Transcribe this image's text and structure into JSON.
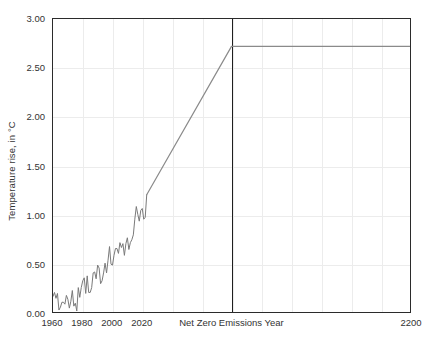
{
  "chart_data": {
    "type": "line",
    "title": "",
    "xlabel": "",
    "ylabel": "Temperature rise, in °C",
    "xlim": [
      1960,
      2200
    ],
    "ylim": [
      0.0,
      3.0
    ],
    "grid": true,
    "legend": null,
    "y_ticks": [
      "0.00",
      "0.50",
      "1.00",
      "1.50",
      "2.00",
      "2.50",
      "3.00"
    ],
    "y_tick_values": [
      0.0,
      0.5,
      1.0,
      1.5,
      2.0,
      2.5,
      3.0
    ],
    "x_ticks": [
      "1960",
      "1980",
      "2000",
      "2020",
      "Net Zero Emissions Year",
      "2200"
    ],
    "x_tick_values": [
      1960,
      1980,
      2000,
      2020,
      2080,
      2200
    ],
    "annotations": [
      {
        "name": "net-zero-emissions-year",
        "label": "Net Zero Emissions Year",
        "x": 2080,
        "type": "vertical-line"
      }
    ],
    "series": [
      {
        "name": "observed-temperature-rise",
        "style": "jagged-annual",
        "color": "#7a7a7a",
        "x": [
          1960,
          1961,
          1962,
          1963,
          1964,
          1965,
          1966,
          1967,
          1968,
          1969,
          1970,
          1971,
          1972,
          1973,
          1974,
          1975,
          1976,
          1977,
          1978,
          1979,
          1980,
          1981,
          1982,
          1983,
          1984,
          1985,
          1986,
          1987,
          1988,
          1989,
          1990,
          1991,
          1992,
          1993,
          1994,
          1995,
          1996,
          1997,
          1998,
          1999,
          2000,
          2001,
          2002,
          2003,
          2004,
          2005,
          2006,
          2007,
          2008,
          2009,
          2010,
          2011,
          2012,
          2013,
          2014,
          2015,
          2016,
          2017,
          2018,
          2019,
          2020,
          2021,
          2022,
          2023
        ],
        "values": [
          0.16,
          0.2,
          0.14,
          0.19,
          0.02,
          0.05,
          0.1,
          0.1,
          0.08,
          0.17,
          0.13,
          0.04,
          0.11,
          0.22,
          0.06,
          0.09,
          0.01,
          0.25,
          0.15,
          0.25,
          0.32,
          0.35,
          0.19,
          0.37,
          0.2,
          0.2,
          0.25,
          0.4,
          0.41,
          0.34,
          0.48,
          0.45,
          0.29,
          0.32,
          0.4,
          0.5,
          0.4,
          0.53,
          0.67,
          0.49,
          0.48,
          0.58,
          0.65,
          0.65,
          0.6,
          0.71,
          0.66,
          0.7,
          0.58,
          0.7,
          0.76,
          0.64,
          0.71,
          0.74,
          0.79,
          0.95,
          1.08,
          1.0,
          0.93,
          1.04,
          1.06,
          0.95,
          0.97,
          1.2
        ]
      },
      {
        "name": "projected-temperature-rise",
        "style": "smooth-linear",
        "color": "#8a8a8a",
        "x": [
          2023,
          2080,
          2200
        ],
        "values": [
          1.2,
          2.72,
          2.72
        ]
      }
    ],
    "peak_warming": 2.72,
    "net_zero_year_label": "Net Zero Emissions Year"
  },
  "axis": {
    "frame_color": "#2b2b2b",
    "grid_color": "#ececec",
    "netzero_line_color": "#1f1f1f"
  }
}
